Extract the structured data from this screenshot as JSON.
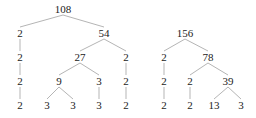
{
  "figure": {
    "type": "factor-trees",
    "trees": [
      {
        "root": "108",
        "nodes": [
          {
            "id": "a0",
            "label": "108",
            "x": 63,
            "y": 13
          },
          {
            "id": "a1",
            "label": "2",
            "x": 20,
            "y": 37
          },
          {
            "id": "a2",
            "label": "54",
            "x": 104,
            "y": 37
          },
          {
            "id": "a3",
            "label": "2",
            "x": 20,
            "y": 61
          },
          {
            "id": "a4",
            "label": "27",
            "x": 80,
            "y": 61
          },
          {
            "id": "a5",
            "label": "2",
            "x": 126,
            "y": 61
          },
          {
            "id": "a6",
            "label": "2",
            "x": 20,
            "y": 85
          },
          {
            "id": "a7",
            "label": "9",
            "x": 59,
            "y": 85
          },
          {
            "id": "a8",
            "label": "3",
            "x": 99,
            "y": 85
          },
          {
            "id": "a9",
            "label": "2",
            "x": 126,
            "y": 85
          },
          {
            "id": "a10",
            "label": "2",
            "x": 20,
            "y": 109
          },
          {
            "id": "a11",
            "label": "3",
            "x": 47,
            "y": 109
          },
          {
            "id": "a12",
            "label": "3",
            "x": 73,
            "y": 109
          },
          {
            "id": "a13",
            "label": "3",
            "x": 99,
            "y": 109
          },
          {
            "id": "a14",
            "label": "2",
            "x": 126,
            "y": 109
          }
        ],
        "edges": [
          [
            "a0",
            "a1"
          ],
          [
            "a0",
            "a2"
          ],
          [
            "a1",
            "a3"
          ],
          [
            "a2",
            "a4"
          ],
          [
            "a2",
            "a5"
          ],
          [
            "a3",
            "a6"
          ],
          [
            "a4",
            "a7"
          ],
          [
            "a4",
            "a8"
          ],
          [
            "a5",
            "a9"
          ],
          [
            "a6",
            "a10"
          ],
          [
            "a7",
            "a11"
          ],
          [
            "a7",
            "a12"
          ],
          [
            "a8",
            "a13"
          ],
          [
            "a9",
            "a14"
          ]
        ]
      },
      {
        "root": "156",
        "nodes": [
          {
            "id": "b0",
            "label": "156",
            "x": 185,
            "y": 37
          },
          {
            "id": "b1",
            "label": "2",
            "x": 164,
            "y": 61
          },
          {
            "id": "b2",
            "label": "78",
            "x": 208,
            "y": 61
          },
          {
            "id": "b3",
            "label": "2",
            "x": 164,
            "y": 85
          },
          {
            "id": "b4",
            "label": "2",
            "x": 190,
            "y": 85
          },
          {
            "id": "b5",
            "label": "39",
            "x": 228,
            "y": 85
          },
          {
            "id": "b6",
            "label": "2",
            "x": 164,
            "y": 109
          },
          {
            "id": "b7",
            "label": "2",
            "x": 190,
            "y": 109
          },
          {
            "id": "b8",
            "label": "13",
            "x": 214,
            "y": 109
          },
          {
            "id": "b9",
            "label": "3",
            "x": 241,
            "y": 109
          }
        ],
        "edges": [
          [
            "b0",
            "b1"
          ],
          [
            "b0",
            "b2"
          ],
          [
            "b1",
            "b3"
          ],
          [
            "b2",
            "b4"
          ],
          [
            "b2",
            "b5"
          ],
          [
            "b3",
            "b6"
          ],
          [
            "b4",
            "b7"
          ],
          [
            "b5",
            "b8"
          ],
          [
            "b5",
            "b9"
          ]
        ]
      }
    ]
  }
}
